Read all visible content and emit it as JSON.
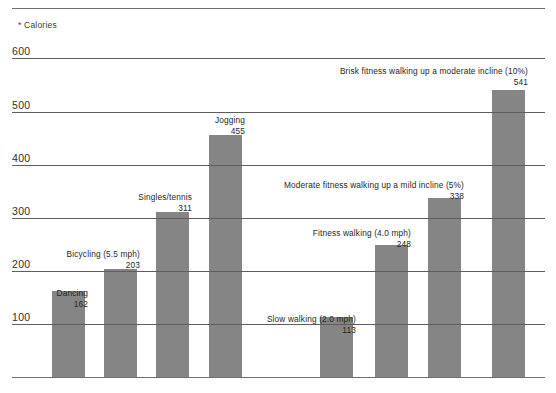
{
  "axis_caption": "* Calories",
  "colors": {
    "bar": "#858585",
    "gridline": "#5e5e5e",
    "frame": "#6f6f6f",
    "text": "#262626"
  },
  "chart_data": {
    "type": "bar",
    "title": "",
    "subtitle": "",
    "xlabel": "",
    "ylabel": "* Calories",
    "ylim": [
      0,
      620
    ],
    "grid": true,
    "legend": "none",
    "yticks": [
      600,
      500,
      400,
      300,
      200,
      100
    ],
    "categories": [
      "Dancing",
      "Bicycling (5.5 mph)",
      "Singles/tennis",
      "Jogging",
      "Slow walking (2.0 mph)",
      "Fitness walking (4.0 mph)",
      "Moderate fitness walking up a mild incline (5%)",
      "Brisk fitness walking up a moderate incline (10%)"
    ],
    "values": [
      162,
      203,
      311,
      455,
      113,
      248,
      338,
      541
    ]
  },
  "bars": [
    {
      "label": "Dancing",
      "value": "162",
      "left": 52,
      "width": 33,
      "anno_right": 88,
      "anno_top": 288
    },
    {
      "label": "Bicycling (5.5 mph)",
      "value": "203",
      "left": 104,
      "width": 33,
      "anno_right": 140,
      "anno_top": 249
    },
    {
      "label": "Singles/tennis",
      "value": "311",
      "left": 156,
      "width": 33,
      "anno_right": 192,
      "anno_top": 192
    },
    {
      "label": "Jogging",
      "value": "455",
      "left": 209,
      "width": 33,
      "anno_right": 245,
      "anno_top": 115
    },
    {
      "label": "Slow walking (2.0 mph)",
      "value": "113",
      "left": 320,
      "width": 33,
      "anno_right": 356,
      "anno_top": 314
    },
    {
      "label": "Fitness walking (4.0 mph)",
      "value": "248",
      "left": 375,
      "width": 33,
      "anno_right": 411,
      "anno_top": 228
    },
    {
      "label": "Moderate fitness walking up a mild incline (5%)",
      "value": "338",
      "left": 428,
      "width": 33,
      "anno_right": 464,
      "anno_top": 180
    },
    {
      "label": "Brisk fitness walking up a moderate incline (10%)",
      "value": "541",
      "left": 492,
      "width": 33,
      "anno_right": 528,
      "anno_top": 66
    }
  ]
}
